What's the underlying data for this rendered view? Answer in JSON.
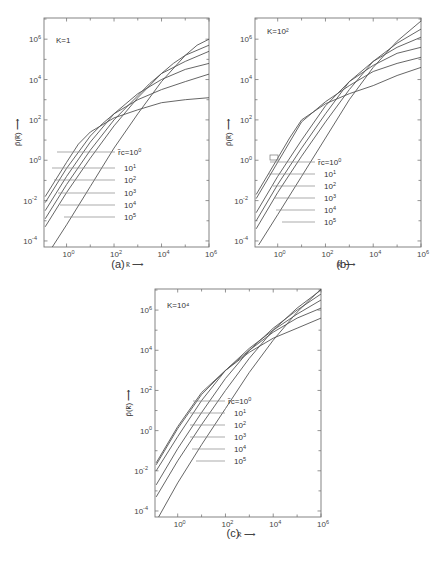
{
  "chart_data": [
    {
      "type": "line",
      "panel_label": "(a)",
      "annotation": "K=1",
      "annotation_base": "K=1",
      "xlabel": "k̃ ⟶",
      "ylabel": "p̃(k̃) ⟶",
      "xscale": "log",
      "yscale": "log",
      "x_ticks": [
        "10^0",
        "10^2",
        "10^4",
        "10^6"
      ],
      "y_ticks": [
        "10^-4",
        "10^-2",
        "10^0",
        "10^2",
        "10^4",
        "10^6"
      ],
      "xlim_log10": [
        -0.95,
        6
      ],
      "ylim_log10": [
        -4.3,
        7.05
      ],
      "legend_prefix": "r̃c=",
      "series": [
        {
          "name": "r̃c=10^0",
          "points_log10": [
            [
              -0.9,
              -1.8
            ],
            [
              0.0,
              -0.1
            ],
            [
              0.5,
              0.8
            ],
            [
              1.0,
              1.4
            ],
            [
              2.0,
              2.1
            ],
            [
              3.0,
              2.5
            ],
            [
              4.0,
              2.85
            ],
            [
              5.0,
              3.0
            ],
            [
              6.0,
              3.1
            ]
          ]
        },
        {
          "name": "r̃c=10^1",
          "points_log10": [
            [
              -0.9,
              -2.1
            ],
            [
              0.0,
              -0.4
            ],
            [
              1.0,
              1.2
            ],
            [
              1.5,
              1.8
            ],
            [
              2.0,
              2.3
            ],
            [
              3.0,
              3.0
            ],
            [
              4.0,
              3.5
            ],
            [
              5.0,
              3.9
            ],
            [
              6.0,
              4.27
            ]
          ]
        },
        {
          "name": "r̃c=10^2",
          "points_log10": [
            [
              -0.9,
              -2.5
            ],
            [
              0.0,
              -0.8
            ],
            [
              1.0,
              0.9
            ],
            [
              2.0,
              2.3
            ],
            [
              2.5,
              2.8
            ],
            [
              3.0,
              3.3
            ],
            [
              4.0,
              4.0
            ],
            [
              5.0,
              4.5
            ],
            [
              6.0,
              4.8
            ]
          ]
        },
        {
          "name": "r̃c=10^3",
          "points_log10": [
            [
              -0.9,
              -2.9
            ],
            [
              0.0,
              -1.2
            ],
            [
              1.0,
              0.5
            ],
            [
              2.0,
              2.0
            ],
            [
              3.0,
              3.2
            ],
            [
              3.5,
              3.8
            ],
            [
              4.0,
              4.3
            ],
            [
              5.0,
              4.9
            ],
            [
              6.0,
              5.4
            ]
          ]
        },
        {
          "name": "r̃c=10^4",
          "points_log10": [
            [
              -0.9,
              -3.3
            ],
            [
              0.0,
              -1.6
            ],
            [
              1.0,
              0.1
            ],
            [
              2.0,
              1.7
            ],
            [
              3.0,
              3.1
            ],
            [
              4.0,
              4.3
            ],
            [
              4.5,
              4.8
            ],
            [
              5.0,
              5.2
            ],
            [
              6.0,
              5.7
            ]
          ]
        },
        {
          "name": "r̃c=10^5",
          "points_log10": [
            [
              -0.6,
              -4.3
            ],
            [
              0.0,
              -3.2
            ],
            [
              1.0,
              -1.3
            ],
            [
              2.0,
              0.6
            ],
            [
              3.0,
              2.3
            ],
            [
              4.0,
              3.9
            ],
            [
              5.0,
              5.2
            ],
            [
              5.5,
              5.7
            ],
            [
              6.0,
              6.0
            ]
          ]
        }
      ],
      "legend_labels": [
        "r̃c=10^0",
        "10^1",
        "10^2",
        "10^3",
        "10^4",
        "10^5"
      ]
    },
    {
      "type": "line",
      "panel_label": "(b)",
      "annotation": "K=10^2",
      "xlabel": "k̃ ⟶",
      "ylabel": "p̃(k̃) ⟶",
      "xscale": "log",
      "yscale": "log",
      "x_ticks": [
        "10^0",
        "10^2",
        "10^4",
        "10^6"
      ],
      "y_ticks": [
        "10^-4",
        "10^-2",
        "10^0",
        "10^2",
        "10^4",
        "10^6"
      ],
      "xlim_log10": [
        -0.95,
        6
      ],
      "ylim_log10": [
        -4.3,
        7.05
      ],
      "series": [
        {
          "name": "r̃c=10^0",
          "points_log10": [
            [
              -0.9,
              -1.7
            ],
            [
              0.0,
              0.1
            ],
            [
              0.5,
              1.1
            ],
            [
              1.0,
              2.0
            ],
            [
              2.0,
              2.8
            ],
            [
              3.0,
              3.3
            ],
            [
              4.0,
              3.7
            ],
            [
              5.0,
              4.2
            ],
            [
              6.0,
              4.6
            ]
          ]
        },
        {
          "name": "r̃c=10^1",
          "points_log10": [
            [
              -0.9,
              -1.9
            ],
            [
              0.0,
              -0.1
            ],
            [
              1.0,
              1.9
            ],
            [
              1.5,
              2.4
            ],
            [
              2.0,
              2.9
            ],
            [
              3.0,
              3.7
            ],
            [
              4.0,
              4.4
            ],
            [
              5.0,
              4.8
            ],
            [
              6.0,
              5.1
            ]
          ]
        },
        {
          "name": "r̃c=10^2",
          "points_log10": [
            [
              -0.9,
              -2.6
            ],
            [
              0.0,
              -0.8
            ],
            [
              1.0,
              1.0
            ],
            [
              2.0,
              2.7
            ],
            [
              2.5,
              3.3
            ],
            [
              3.0,
              3.9
            ],
            [
              4.0,
              4.7
            ],
            [
              5.0,
              5.3
            ],
            [
              6.0,
              5.6
            ]
          ]
        },
        {
          "name": "r̃c=10^3",
          "points_log10": [
            [
              -0.9,
              -3.0
            ],
            [
              0.0,
              -1.2
            ],
            [
              1.0,
              0.6
            ],
            [
              2.0,
              2.3
            ],
            [
              3.0,
              3.9
            ],
            [
              4.0,
              4.9
            ],
            [
              5.0,
              5.6
            ],
            [
              6.0,
              6.1
            ]
          ]
        },
        {
          "name": "r̃c=10^4",
          "points_log10": [
            [
              -0.9,
              -3.4
            ],
            [
              0.0,
              -1.6
            ],
            [
              1.0,
              0.2
            ],
            [
              2.0,
              1.9
            ],
            [
              3.0,
              3.5
            ],
            [
              4.0,
              4.9
            ],
            [
              5.0,
              5.8
            ],
            [
              6.0,
              6.5
            ]
          ]
        },
        {
          "name": "r̃c=10^5",
          "points_log10": [
            [
              -0.8,
              -4.2
            ],
            [
              0.0,
              -2.7
            ],
            [
              1.0,
              -0.8
            ],
            [
              2.0,
              1.1
            ],
            [
              3.0,
              3.0
            ],
            [
              4.0,
              4.6
            ],
            [
              5.0,
              5.9
            ],
            [
              6.0,
              6.9
            ]
          ]
        }
      ],
      "legend_labels": [
        "r̃c=10^0",
        "10^1",
        "10^2",
        "10^3",
        "10^4",
        "10^5"
      ]
    },
    {
      "type": "line",
      "panel_label": "(c)",
      "annotation": "K=10^4",
      "xlabel": "k̃ ⟶",
      "ylabel": "p̃(k̃) ⟶",
      "xscale": "log",
      "yscale": "log",
      "x_ticks": [
        "10^0",
        "10^2",
        "10^4",
        "10^6"
      ],
      "y_ticks": [
        "10^-4",
        "10^-2",
        "10^0",
        "10^2",
        "10^4",
        "10^6"
      ],
      "xlim_log10": [
        -0.95,
        6
      ],
      "ylim_log10": [
        -4.3,
        7.05
      ],
      "series": [
        {
          "name": "r̃c=10^0",
          "points_log10": [
            [
              -0.9,
              -1.6
            ],
            [
              0.0,
              0.2
            ],
            [
              1.0,
              1.9
            ],
            [
              2.0,
              3.0
            ],
            [
              3.0,
              3.9
            ],
            [
              4.0,
              4.6
            ],
            [
              5.0,
              5.1
            ],
            [
              6.0,
              5.6
            ]
          ]
        },
        {
          "name": "r̃c=10^1",
          "points_log10": [
            [
              -0.9,
              -1.7
            ],
            [
              0.0,
              0.1
            ],
            [
              1.0,
              1.8
            ],
            [
              2.0,
              3.0
            ],
            [
              3.0,
              4.0
            ],
            [
              4.0,
              4.9
            ],
            [
              5.0,
              5.6
            ],
            [
              6.0,
              6.1
            ]
          ]
        },
        {
          "name": "r̃c=10^2",
          "points_log10": [
            [
              -0.9,
              -2.0
            ],
            [
              0.0,
              -0.3
            ],
            [
              1.0,
              1.5
            ],
            [
              2.0,
              3.0
            ],
            [
              3.0,
              4.1
            ],
            [
              4.0,
              5.0
            ],
            [
              5.0,
              5.8
            ],
            [
              6.0,
              6.5
            ]
          ]
        },
        {
          "name": "r̃c=10^3",
          "points_log10": [
            [
              -0.9,
              -2.7
            ],
            [
              0.0,
              -0.9
            ],
            [
              1.0,
              0.9
            ],
            [
              2.0,
              2.6
            ],
            [
              3.0,
              4.0
            ],
            [
              4.0,
              5.1
            ],
            [
              5.0,
              6.0
            ],
            [
              6.0,
              6.8
            ]
          ]
        },
        {
          "name": "r̃c=10^4",
          "points_log10": [
            [
              -0.9,
              -3.3
            ],
            [
              0.0,
              -1.5
            ],
            [
              1.0,
              0.3
            ],
            [
              2.0,
              2.0
            ],
            [
              3.0,
              3.6
            ],
            [
              4.0,
              5.0
            ],
            [
              5.0,
              6.1
            ],
            [
              6.0,
              7.0
            ]
          ]
        },
        {
          "name": "r̃c=10^5",
          "points_log10": [
            [
              -0.8,
              -4.3
            ],
            [
              0.0,
              -2.6
            ],
            [
              1.0,
              -0.7
            ],
            [
              2.0,
              1.1
            ],
            [
              3.0,
              2.9
            ],
            [
              4.0,
              4.5
            ],
            [
              5.0,
              5.9
            ],
            [
              6.0,
              7.05
            ]
          ]
        }
      ],
      "legend_labels": [
        "r̃c=10^0",
        "10^1",
        "10^2",
        "10^3",
        "10^4",
        "10^5"
      ]
    }
  ],
  "panels": [
    {
      "label": "(a)",
      "k_label": "K=1"
    },
    {
      "label": "(b)",
      "k_label": "K=10²"
    },
    {
      "label": "(c)",
      "k_label": "K=10⁴"
    }
  ],
  "axis_text": {
    "x_axis_label": "k̃ ⟶",
    "y_axis_label": "p̃(k̃) ⟶",
    "x_tick_exps": [
      "0",
      "2",
      "4",
      "6"
    ],
    "y_tick_exps": [
      "6",
      "4",
      "2",
      "0",
      "-2",
      "-4"
    ],
    "tick_base": "10",
    "legend_first_prefix": "r̃c=10",
    "legend_exps": [
      "0",
      "1",
      "2",
      "3",
      "4",
      "5"
    ]
  }
}
